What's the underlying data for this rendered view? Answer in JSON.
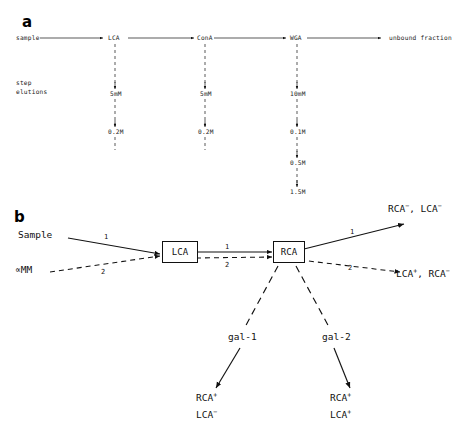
{
  "panels": {
    "a": {
      "letter": "a",
      "sample_label": "sample",
      "step_label_line1": "step",
      "step_label_line2": "elutions",
      "unbound_label": "unbound fraction",
      "columns": [
        {
          "name": "LCA",
          "elutions": [
            "5mM",
            "0.2M"
          ]
        },
        {
          "name": "ConA",
          "elutions": [
            "5mM",
            "0.2M"
          ]
        },
        {
          "name": "WGA",
          "elutions": [
            "10mM",
            "0.1M",
            "0.5M",
            "1.5M"
          ]
        }
      ]
    },
    "b": {
      "letter": "b",
      "input_sample": "Sample",
      "input_competitor": "∝MM",
      "boxes": [
        "LCA",
        "RCA"
      ],
      "path_labels": {
        "p1a": "1",
        "p2a": "2",
        "p1b": "1",
        "p2b": "2",
        "p1c": "1",
        "p2c": "2"
      },
      "galectins": [
        "gal-1",
        "gal-2"
      ],
      "outputs": {
        "top_right_line1": "RCA",
        "top_right_sup1": "−",
        "top_right_mid": ", LCA",
        "top_right_sup2": "−",
        "bottom_right_line1": "LCA",
        "bottom_right_sup1": "+",
        "bottom_right_mid": ", RCA",
        "bottom_right_sup2": "−",
        "gal1_out_line1": "RCA",
        "gal1_out_sup1": "+",
        "gal1_out_line2": "LCA",
        "gal1_out_sup2": "−",
        "gal2_out_line1": "RCA",
        "gal2_out_sup1": "+",
        "gal2_out_line2": "LCA",
        "gal2_out_sup2": "+"
      }
    }
  },
  "colors": {
    "ink": "#111111",
    "background": "#ffffff"
  }
}
